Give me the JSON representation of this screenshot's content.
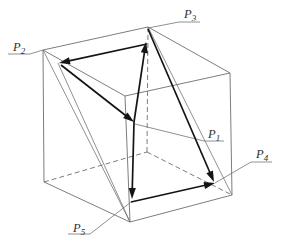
{
  "diagram": {
    "type": "wireframe-cube-with-vector-arrows",
    "background": "#ffffff",
    "colors": {
      "edge": "#6e6e6e",
      "construction": "#747474",
      "arrow": "#141414",
      "label": "#2f2f2f"
    },
    "labels": [
      {
        "id": "P1",
        "text": "P",
        "subscript": "1",
        "x": 208,
        "y": 138
      },
      {
        "id": "P2",
        "text": "P",
        "subscript": "2",
        "x": 13,
        "y": 51
      },
      {
        "id": "P3",
        "text": "P",
        "subscript": "3",
        "x": 184,
        "y": 18
      },
      {
        "id": "P4",
        "text": "P",
        "subscript": "4",
        "x": 256,
        "y": 158
      },
      {
        "id": "P5",
        "text": "P",
        "subscript": "5",
        "x": 73,
        "y": 232
      }
    ],
    "vertices": {
      "A": [
        43,
        50
      ],
      "B": [
        148,
        27
      ],
      "C": [
        230,
        73
      ],
      "G": [
        125,
        96
      ],
      "F": [
        44,
        182
      ],
      "H": [
        147,
        152
      ],
      "D": [
        232,
        195
      ],
      "E": [
        130,
        222
      ]
    },
    "solid_edges": [
      [
        "A",
        "B"
      ],
      [
        "B",
        "C"
      ],
      [
        "C",
        "G"
      ],
      [
        "G",
        "A"
      ],
      [
        "A",
        "F"
      ],
      [
        "C",
        "D"
      ],
      [
        "G",
        "E"
      ],
      [
        "F",
        "E"
      ],
      [
        "E",
        "D"
      ]
    ],
    "dashed_edges": [
      [
        "B",
        "H"
      ],
      [
        "F",
        "H"
      ],
      [
        "H",
        "D"
      ]
    ],
    "construction_lines": [
      [
        [
          43,
          50
        ],
        [
          130,
          222
        ]
      ],
      [
        [
          58,
          63
        ],
        [
          130,
          222
        ]
      ],
      [
        [
          148,
          27
        ],
        [
          232,
          195
        ]
      ]
    ],
    "arrows": [
      {
        "from": [
          147,
          44
        ],
        "to": [
          59,
          63
        ]
      },
      {
        "from": [
          61,
          65
        ],
        "to": [
          134,
          122
        ]
      },
      {
        "from": [
          134,
          122
        ],
        "to": [
          146,
          42
        ]
      },
      {
        "from": [
          134,
          122
        ],
        "to": [
          132,
          199
        ]
      },
      {
        "from": [
          131,
          202
        ],
        "to": [
          215,
          183
        ]
      },
      {
        "from": [
          148,
          29
        ],
        "to": [
          214,
          182
        ]
      }
    ],
    "leader_lines": [
      {
        "label": "P3",
        "points": [
          [
            200,
            22
          ],
          [
            179,
            22
          ],
          [
            148,
            28
          ]
        ]
      },
      {
        "label": "P2",
        "points": [
          [
            8,
            54
          ],
          [
            30,
            54
          ],
          [
            43,
            50
          ]
        ]
      },
      {
        "label": "P1",
        "points": [
          [
            224,
            141
          ],
          [
            204,
            141
          ],
          [
            135,
            124
          ]
        ]
      },
      {
        "label": "P4",
        "points": [
          [
            272,
            162
          ],
          [
            251,
            162
          ],
          [
            215,
            183
          ]
        ]
      },
      {
        "label": "P5",
        "points": [
          [
            68,
            234
          ],
          [
            90,
            234
          ],
          [
            131,
            202
          ]
        ]
      }
    ]
  }
}
